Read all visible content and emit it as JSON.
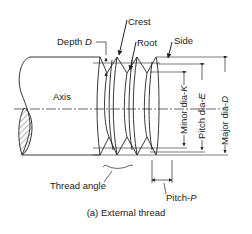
{
  "figure": {
    "caption": "(a) External thread",
    "labels": {
      "depth": {
        "text": "Depth ",
        "var": "D"
      },
      "crest": "Crest",
      "root": "Root",
      "side": "Side",
      "axis": "Axis",
      "thread_angle": "Thread angle",
      "pitch": {
        "text": "Pitch-",
        "var": "P"
      },
      "minor_dia": {
        "text": "Minor dia-",
        "var": "K"
      },
      "pitch_dia": {
        "text": "Pitch dia-",
        "var": "E"
      },
      "major_dia": {
        "text": "Major dia-",
        "var": "D"
      }
    }
  }
}
